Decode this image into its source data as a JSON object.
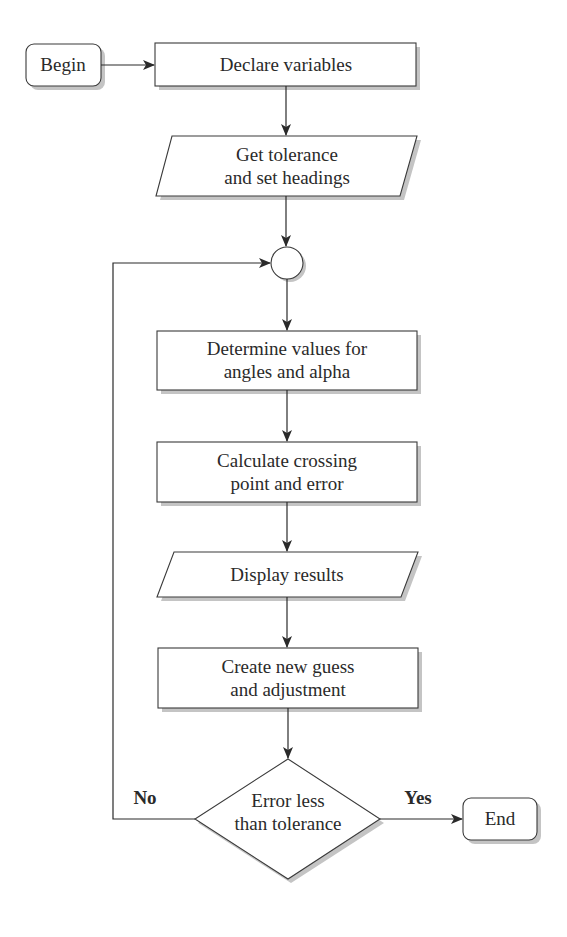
{
  "diagram": {
    "type": "flowchart",
    "nodes": [
      {
        "id": "begin",
        "shape": "rounded-rect",
        "label": "Begin"
      },
      {
        "id": "declare",
        "shape": "rect",
        "label": "Declare variables"
      },
      {
        "id": "get_tol",
        "shape": "parallelogram",
        "line1": "Get tolerance",
        "line2": "and set headings"
      },
      {
        "id": "connector",
        "shape": "circle",
        "label": ""
      },
      {
        "id": "determine",
        "shape": "rect",
        "line1": "Determine values for",
        "line2": "angles and alpha"
      },
      {
        "id": "calculate",
        "shape": "rect",
        "line1": "Calculate crossing",
        "line2": "point and error"
      },
      {
        "id": "display",
        "shape": "parallelogram",
        "label": "Display results"
      },
      {
        "id": "create",
        "shape": "rect",
        "line1": "Create new guess",
        "line2": "and adjustment"
      },
      {
        "id": "decision",
        "shape": "diamond",
        "line1": "Error less",
        "line2": "than tolerance"
      },
      {
        "id": "end",
        "shape": "rounded-rect",
        "label": "End"
      }
    ],
    "edges": [
      {
        "from": "begin",
        "to": "declare"
      },
      {
        "from": "declare",
        "to": "get_tol"
      },
      {
        "from": "get_tol",
        "to": "connector"
      },
      {
        "from": "connector",
        "to": "determine"
      },
      {
        "from": "determine",
        "to": "calculate"
      },
      {
        "from": "calculate",
        "to": "display"
      },
      {
        "from": "display",
        "to": "create"
      },
      {
        "from": "create",
        "to": "decision"
      },
      {
        "from": "decision",
        "to": "end",
        "label": "Yes"
      },
      {
        "from": "decision",
        "to": "connector",
        "label": "No"
      }
    ],
    "branch_labels": {
      "yes": "Yes",
      "no": "No"
    }
  },
  "colors": {
    "stroke": "#3a3a3a",
    "shadow": "#b8b8b8",
    "fill": "#ffffff"
  }
}
